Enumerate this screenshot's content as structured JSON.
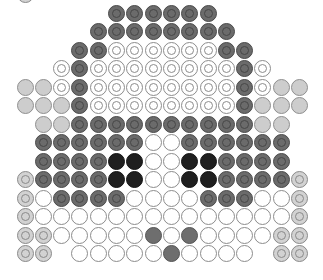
{
  "pattern": {
    "title": "",
    "grid": {
      "columns": 16,
      "rows": 14,
      "origin_x": 25,
      "origin_y": 13,
      "step_x": 18.3,
      "step_y": 18.5,
      "bead_diameter": 17
    },
    "palette": {
      "D": {
        "name": "dark-gray-ring",
        "class": "b-dark",
        "color": "#6b6b6b"
      },
      "K": {
        "name": "black",
        "class": "b-black",
        "color": "#1f1f1f"
      },
      "L": {
        "name": "light-gray",
        "class": "b-lightgray",
        "color": "#cdcdcd"
      },
      "R": {
        "name": "light-gray-ring",
        "class": "b-lightring",
        "color": "#d2d2d2"
      },
      "O": {
        "name": "white-ring",
        "class": "b-whitering",
        "color": "#ffffff"
      },
      "W": {
        "name": "white",
        "class": "b-white",
        "color": "#ffffff"
      },
      "G": {
        "name": "gray",
        "class": "b-gray",
        "color": "#6e6e6e"
      }
    },
    "extra_beads": [
      {
        "row": -1,
        "col": 0,
        "code": "R"
      }
    ],
    "rows": [
      ".....DDDDDD.....",
      "....DDDDDDDD....",
      "...DDOOOOOODD...",
      "..ODOOOOOOOODO..",
      "LLODOOOOOOOODOLL",
      "LLLDOOOOOOOODLLL",
      ".LLDDDDDDDDDDLL.",
      ".DDDDDDWWDDDDDD.",
      ".DDDDKKWWKKDDDD.",
      "RDDDDKKWWKKDDDDR",
      "RWDDDDWWWWDDDWWR",
      "RWWWWWWWWWWWWWWR",
      "RRWWWWWGWGWWWWRR",
      "RR.WWWWWGWWWW.RR"
    ]
  }
}
